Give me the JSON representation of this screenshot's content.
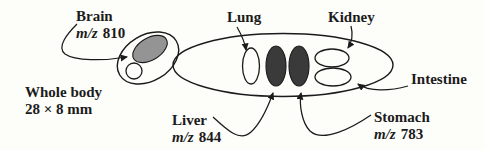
{
  "figure": {
    "title_meaning": "Whole-body section diagram with organ labels and m/z values",
    "colors": {
      "background": "#fdfdfa",
      "line": "#1b1b1b",
      "brain_fill": "#949494",
      "dark_organ_fill": "#3a3a3a"
    },
    "labels": {
      "brain": {
        "name": "Brain",
        "mz_prefix": "m/z",
        "mz_value": "810"
      },
      "lung": {
        "name": "Lung"
      },
      "kidney": {
        "name": "Kidney"
      },
      "intestine": {
        "name": "Intestine"
      },
      "liver": {
        "name": "Liver",
        "mz_prefix": "m/z",
        "mz_value": "844"
      },
      "stomach": {
        "name": "Stomach",
        "mz_prefix": "m/z",
        "mz_value": "783"
      },
      "whole_body": {
        "line1": "Whole body",
        "line2": "28 × 8 mm"
      }
    }
  }
}
